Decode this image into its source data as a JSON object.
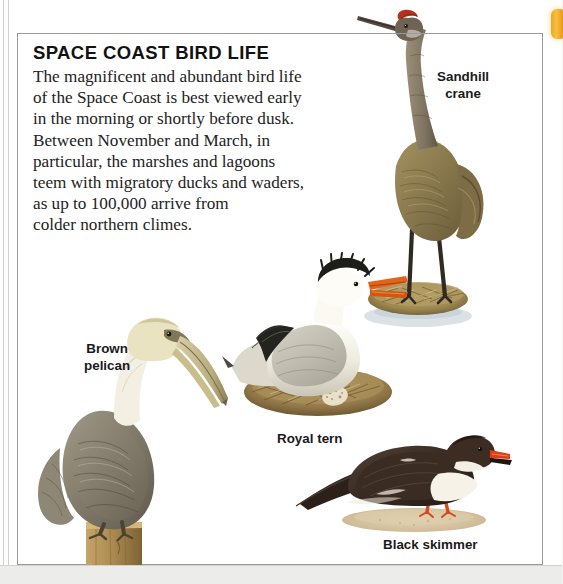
{
  "page": {
    "headline": "SPACE COAST BIRD LIFE",
    "body_lines": [
      "The magnificent and abundant bird life",
      "of the Space Coast is best viewed early",
      "in the morning or shortly before dusk.",
      "Between November and March, in",
      "particular, the marshes and lagoons",
      "teem with migratory ducks and waders,",
      "as up to 100,000 arrive from",
      "colder northern climes."
    ]
  },
  "captions": {
    "crane_line1": "Sandhill",
    "crane_line2": "crane",
    "pelican_line1": "Brown",
    "pelican_line2": "pelican",
    "tern": "Royal tern",
    "skimmer": "Black skimmer"
  },
  "illustrations": [
    {
      "name": "sandhill-crane",
      "caption": "Sandhill crane"
    },
    {
      "name": "brown-pelican",
      "caption": "Brown pelican"
    },
    {
      "name": "royal-tern",
      "caption": "Royal tern"
    },
    {
      "name": "black-skimmer",
      "caption": "Black skimmer"
    }
  ],
  "colors": {
    "tab_accent": "#f0a81e",
    "frame_border": "#9a9a9a",
    "page_background": "#ffffff",
    "crane_body": "#8c7a52",
    "crane_crown": "#b4321e",
    "pelican_body": "#8c8474",
    "pelican_head": "#e8e2c4",
    "tern_body": "#f2efe8",
    "tern_bill": "#e2641c",
    "skimmer_body": "#3a2a22",
    "skimmer_bill": "#e03c18",
    "nest_straw": "#a8935e",
    "water": "#cfd8de",
    "sand": "#d9c8ac",
    "post_wood": "#b08f55"
  }
}
